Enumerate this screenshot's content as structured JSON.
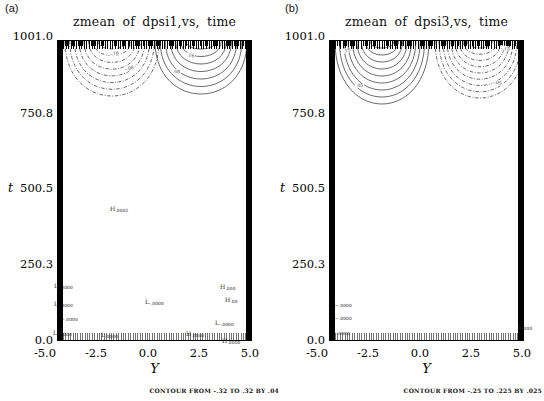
{
  "figure": {
    "panels": [
      {
        "corner_label": "(a)",
        "title": "zmean of dpsi1,vs, time",
        "y_axis": {
          "label": "t",
          "ticks": [
            "1001.0",
            "750.8",
            "500.5",
            "250.3",
            "0.0"
          ]
        },
        "x_axis": {
          "label": "Y",
          "ticks": [
            "-5.0",
            "-2.5",
            "0.0",
            "2.5",
            "5.0"
          ]
        },
        "caption": "CONTOUR FROM -.32 TO .32 BY .04",
        "contour_families": [
          {
            "style": "dashed",
            "cx": 112,
            "hw0": 14,
            "hw1": 47,
            "d0": 8,
            "d1": 55,
            "count": 8
          },
          {
            "style": "solid",
            "cx": 201,
            "hw0": 15,
            "hw1": 46,
            "d0": 8,
            "d1": 53,
            "count": 7
          }
        ],
        "contour_labels": [
          {
            "text": "-.16",
            "x": 109,
            "y": 51,
            "rot": -12
          },
          {
            "text": "-.08",
            "x": 124,
            "y": 66,
            "rot": -15
          },
          {
            "text": ".16",
            "x": 186,
            "y": 53,
            "rot": 8
          },
          {
            "text": ".08",
            "x": 172,
            "y": 69,
            "rot": 10
          }
        ],
        "extrema": [
          {
            "t": "H",
            "v": ".0002",
            "x": 110,
            "y": 206
          },
          {
            "t": "L",
            "v": "-.0000",
            "x": 54,
            "y": 283
          },
          {
            "t": "L",
            "v": "-.0000",
            "x": 54,
            "y": 301
          },
          {
            "t": "L",
            "v": "-.0000",
            "x": 59,
            "y": 315
          },
          {
            "t": "L",
            "v": "-.0000",
            "x": 53,
            "y": 330
          },
          {
            "t": "L",
            "v": ".0000",
            "x": 101,
            "y": 332
          },
          {
            "t": "L",
            "v": "-.0000",
            "x": 145,
            "y": 299
          },
          {
            "t": "H",
            "v": ".000",
            "x": 220,
            "y": 284
          },
          {
            "t": "H",
            "v": ".00",
            "x": 225,
            "y": 297
          },
          {
            "t": "L",
            "v": "-.0000",
            "x": 215,
            "y": 320
          },
          {
            "t": "H",
            "v": ".0000",
            "x": 186,
            "y": 331
          },
          {
            "t": "H",
            "v": ".0000",
            "x": 222,
            "y": 338,
            "above": true
          }
        ]
      },
      {
        "corner_label": "(b)",
        "title": "zmean of dpsi3,vs, time",
        "y_axis": {
          "label": "t",
          "ticks": [
            "1001.0",
            "750.8",
            "500.5",
            "250.3",
            "0.0"
          ]
        },
        "x_axis": {
          "label": "Y",
          "ticks": [
            "-5.0",
            "-2.5",
            "0.0",
            "2.5",
            "5.0"
          ]
        },
        "caption": "CONTOUR FROM -.25 TO .225 BY .025",
        "contour_families": [
          {
            "style": "solid",
            "cx": 110,
            "hw0": 12,
            "hw1": 47,
            "d0": 7,
            "d1": 63,
            "count": 9
          },
          {
            "style": "dashed",
            "cx": 208,
            "hw0": 13,
            "hw1": 45,
            "d0": 7,
            "d1": 57,
            "count": 9
          }
        ],
        "contour_labels": [
          {
            "text": ".15",
            "x": 70,
            "y": 48,
            "rot": -10
          },
          {
            "text": ".05",
            "x": 83,
            "y": 83,
            "rot": -8
          },
          {
            "text": "-.15",
            "x": 228,
            "y": 46,
            "rot": 10
          },
          {
            "text": "-.05",
            "x": 220,
            "y": 80,
            "rot": 8
          }
        ],
        "extrema": [
          {
            "t": "L",
            "v": "-.0000",
            "x": 61,
            "y": 301
          },
          {
            "t": "L",
            "v": "-.0000",
            "x": 61,
            "y": 314
          },
          {
            "t": "L",
            "v": "-.0000",
            "x": 59,
            "y": 329
          },
          {
            "t": "L",
            "v": ".000",
            "x": 246,
            "y": 324,
            "above": true
          }
        ]
      }
    ]
  },
  "chart_data": [
    {
      "type": "heatmap",
      "subtype": "contour-plot",
      "title": "zmean of dpsi1,vs, time",
      "xlabel": "Y",
      "ylabel": "t",
      "xlim": [
        -5.0,
        5.0
      ],
      "ylim": [
        0.0,
        1001.0
      ],
      "x_ticks": [
        -5.0,
        -2.5,
        0.0,
        2.5,
        5.0
      ],
      "y_ticks": [
        0.0,
        250.3,
        500.5,
        750.8,
        1001.0
      ],
      "contour_levels": {
        "from": -0.32,
        "to": 0.32,
        "by": 0.04
      },
      "line_convention": {
        "negative": "dash-dot",
        "positive": "solid"
      },
      "labeled_contours": [
        -0.16,
        -0.08,
        0.08,
        0.16
      ],
      "lobes": [
        {
          "sign": "negative",
          "style": "dashed",
          "center_Y": -2.2,
          "attached_to": "t=1001 top boundary",
          "t_extent": [
            818,
            1001
          ]
        },
        {
          "sign": "positive",
          "style": "solid",
          "center_Y": 2.4,
          "attached_to": "t=1001 top boundary",
          "t_extent": [
            825,
            1001
          ]
        }
      ],
      "extrema": [
        {
          "label": "H",
          "value": ".0002",
          "Y": -2.3,
          "t": 450
        },
        {
          "label": "L",
          "value": "-.0000",
          "Y": -5.0,
          "t": 193
        },
        {
          "label": "L",
          "value": "-.0000",
          "Y": -5.0,
          "t": 133
        },
        {
          "label": "L",
          "value": "-.0000",
          "Y": -4.9,
          "t": 86
        },
        {
          "label": "L",
          "value": "-.0000",
          "Y": -5.0,
          "t": 37
        },
        {
          "label": "L",
          "value": ".0000",
          "Y": -2.7,
          "t": 30
        },
        {
          "label": "L",
          "value": "-.0000",
          "Y": -0.5,
          "t": 140
        },
        {
          "label": "H",
          "value": ".000",
          "Y": 3.4,
          "t": 190
        },
        {
          "label": "H",
          "value": ".00",
          "Y": 3.6,
          "t": 146
        },
        {
          "label": "L",
          "value": "-.0000",
          "Y": 3.1,
          "t": 70
        },
        {
          "label": "H",
          "value": ".0000",
          "Y": 1.6,
          "t": 33
        },
        {
          "label": "H",
          "value": ".0000",
          "Y": 3.5,
          "t": 10
        }
      ],
      "boundaries": "thick solid walls at Y=-5 and Y=+5; hatched strips along t=0 and t=1001"
    },
    {
      "type": "heatmap",
      "subtype": "contour-plot",
      "title": "zmean of dpsi3,vs, time",
      "xlabel": "Y",
      "ylabel": "t",
      "xlim": [
        -5.0,
        5.0
      ],
      "ylim": [
        0.0,
        1001.0
      ],
      "x_ticks": [
        -5.0,
        -2.5,
        0.0,
        2.5,
        5.0
      ],
      "y_ticks": [
        0.0,
        250.3,
        500.5,
        750.8,
        1001.0
      ],
      "contour_levels": {
        "from": -0.25,
        "to": 0.225,
        "by": 0.025
      },
      "line_convention": {
        "negative": "dash-dot",
        "positive": "solid"
      },
      "labeled_contours": [
        0.15,
        0.05,
        -0.05,
        -0.15
      ],
      "lobes": [
        {
          "sign": "positive",
          "style": "solid",
          "center_Y": -2.3,
          "attached_to": "t=1001 top boundary",
          "t_extent": [
            790,
            1001
          ]
        },
        {
          "sign": "negative",
          "style": "dashed",
          "center_Y": 2.7,
          "attached_to": "t=1001 top boundary",
          "t_extent": [
            810,
            1001
          ]
        }
      ],
      "extrema": [
        {
          "label": "L",
          "value": "-.0000",
          "Y": -4.8,
          "t": 133
        },
        {
          "label": "L",
          "value": "-.0000",
          "Y": -4.8,
          "t": 90
        },
        {
          "label": "L",
          "value": "-.0000",
          "Y": -4.9,
          "t": 40
        },
        {
          "label": "L",
          "value": ".000",
          "Y": 4.7,
          "t": 57
        }
      ],
      "boundaries": "thick solid walls at Y=-5 and Y=+5; hatched strips along t=0 and t=1001"
    }
  ]
}
